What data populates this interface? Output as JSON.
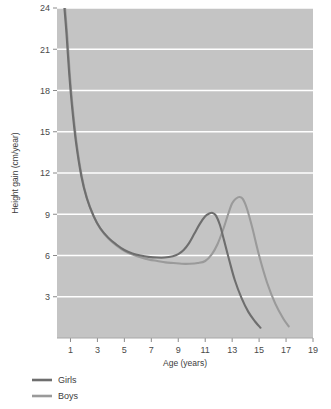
{
  "chart_data": {
    "type": "line",
    "title": "",
    "xlabel": "Age (years)",
    "ylabel": "Height gain (cm/year)",
    "xlim": [
      0,
      19
    ],
    "ylim": [
      0,
      24
    ],
    "xticks": [
      1,
      3,
      5,
      7,
      9,
      11,
      13,
      15,
      17,
      19
    ],
    "yticks": [
      3,
      6,
      9,
      12,
      15,
      18,
      21,
      24
    ],
    "grid": "horizontal",
    "legend_position": "below-left",
    "plot_background": "#c4c4c4",
    "gridline_color": "#ffffff",
    "series": [
      {
        "name": "Girls",
        "color": "#6e6e6e",
        "x": [
          0.55,
          0.7,
          0.9,
          1.1,
          1.4,
          1.8,
          2.2,
          2.7,
          3.2,
          3.8,
          4.4,
          5.0,
          5.6,
          6.2,
          6.8,
          7.4,
          8.0,
          8.6,
          9.0,
          9.4,
          9.8,
          10.2,
          10.6,
          11.0,
          11.3,
          11.55,
          11.8,
          12.1,
          12.4,
          12.8,
          13.2,
          13.7,
          14.2,
          14.7,
          15.1
        ],
        "y": [
          24.0,
          22.2,
          19.3,
          17.0,
          14.3,
          11.8,
          10.2,
          8.9,
          8.0,
          7.3,
          6.8,
          6.4,
          6.15,
          6.0,
          5.9,
          5.85,
          5.85,
          5.95,
          6.1,
          6.4,
          6.9,
          7.6,
          8.3,
          8.85,
          9.05,
          9.1,
          8.9,
          8.2,
          7.1,
          5.6,
          4.2,
          2.9,
          1.9,
          1.2,
          0.75
        ]
      },
      {
        "name": "Boys",
        "color": "#9a9a9a",
        "x": [
          0.6,
          0.75,
          0.95,
          1.15,
          1.45,
          1.85,
          2.25,
          2.75,
          3.25,
          3.85,
          4.45,
          5.05,
          5.65,
          6.25,
          6.85,
          7.45,
          8.05,
          8.65,
          9.25,
          9.85,
          10.45,
          11.0,
          11.5,
          11.9,
          12.3,
          12.7,
          13.0,
          13.3,
          13.55,
          13.8,
          14.1,
          14.5,
          15.0,
          15.6,
          16.2,
          16.8,
          17.2
        ],
        "y": [
          24.0,
          22.1,
          19.2,
          16.9,
          14.2,
          11.7,
          10.1,
          8.8,
          7.9,
          7.2,
          6.7,
          6.3,
          6.05,
          5.85,
          5.7,
          5.6,
          5.5,
          5.45,
          5.4,
          5.4,
          5.45,
          5.6,
          6.1,
          6.8,
          7.8,
          9.0,
          9.8,
          10.15,
          10.25,
          10.1,
          9.4,
          8.0,
          6.0,
          4.0,
          2.5,
          1.4,
          0.85
        ]
      }
    ],
    "annotations": []
  },
  "legend": {
    "items": [
      {
        "label": "Girls",
        "color": "#6e6e6e"
      },
      {
        "label": "Boys",
        "color": "#9a9a9a"
      }
    ]
  },
  "axes": {
    "x_title": "Age (years)",
    "y_title": "Height gain (cm/year)",
    "x_tick_labels": [
      "1",
      "3",
      "5",
      "7",
      "9",
      "11",
      "13",
      "15",
      "17",
      "19"
    ],
    "y_tick_labels": [
      "3",
      "6",
      "9",
      "12",
      "15",
      "18",
      "21",
      "24"
    ]
  }
}
